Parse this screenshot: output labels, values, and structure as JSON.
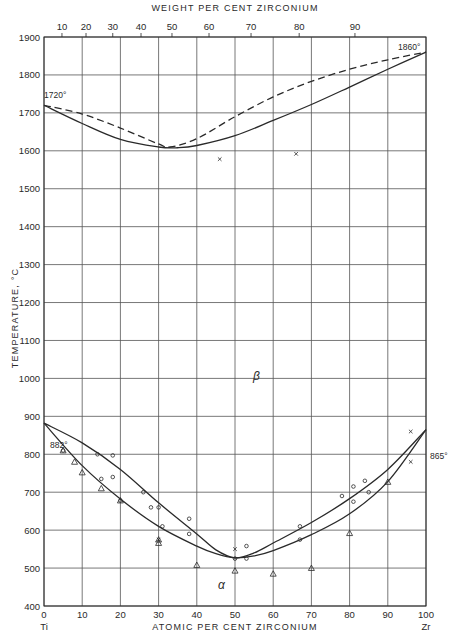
{
  "chart_data": {
    "type": "line",
    "title": "",
    "xlabel": "ATOMIC PER CENT ZIRCONIUM",
    "x2label": "WEIGHT PER CENT ZIRCONIUM",
    "ylabel": "TEMPERATURE, °C",
    "xlim": [
      0,
      100
    ],
    "ylim": [
      400,
      1900
    ],
    "grid": true,
    "x_ticks": [
      0,
      10,
      20,
      30,
      40,
      50,
      60,
      70,
      80,
      90,
      100
    ],
    "x_ticks_labels": [
      "0",
      "10",
      "20",
      "30",
      "40",
      "50",
      "60",
      "70",
      "80",
      "90",
      "100"
    ],
    "x_end_labels": {
      "left": "Ti",
      "right": "Zr"
    },
    "x2_ticks": [
      {
        "label": "10",
        "atomic_pct": 4.7
      },
      {
        "label": "20",
        "atomic_pct": 11.0
      },
      {
        "label": "30",
        "atomic_pct": 18.0
      },
      {
        "label": "40",
        "atomic_pct": 25.4
      },
      {
        "label": "50",
        "atomic_pct": 33.5
      },
      {
        "label": "60",
        "atomic_pct": 43.2
      },
      {
        "label": "70",
        "atomic_pct": 54.2
      },
      {
        "label": "80",
        "atomic_pct": 66.8
      },
      {
        "label": "90",
        "atomic_pct": 81.4
      }
    ],
    "y_ticks": [
      400,
      500,
      600,
      700,
      800,
      900,
      1000,
      1100,
      1200,
      1300,
      1400,
      1500,
      1600,
      1700,
      1800,
      1900
    ],
    "series": [
      {
        "name": "Liquidus (dashed)",
        "style": "dashed",
        "x": [
          0,
          10,
          20,
          30,
          33,
          40,
          50,
          60,
          70,
          80,
          90,
          100
        ],
        "y": [
          1720,
          1697,
          1660,
          1618,
          1610,
          1632,
          1690,
          1742,
          1783,
          1815,
          1840,
          1860
        ]
      },
      {
        "name": "Solidus (solid)",
        "style": "solid",
        "x": [
          0,
          10,
          20,
          30,
          35,
          40,
          50,
          60,
          70,
          80,
          90,
          100
        ],
        "y": [
          1720,
          1672,
          1630,
          1610,
          1608,
          1614,
          1640,
          1680,
          1722,
          1768,
          1815,
          1860
        ]
      },
      {
        "name": "Beta transus (upper, solid)",
        "style": "solid",
        "x": [
          0,
          10,
          20,
          30,
          40,
          45,
          50,
          55,
          60,
          70,
          80,
          90,
          100
        ],
        "y": [
          882,
          830,
          760,
          672,
          590,
          548,
          527,
          540,
          566,
          620,
          683,
          760,
          865
        ]
      },
      {
        "name": "Alpha transus (lower, solid)",
        "style": "solid",
        "x": [
          0,
          10,
          20,
          30,
          40,
          45,
          50,
          55,
          60,
          70,
          80,
          90,
          100
        ],
        "y": [
          882,
          770,
          682,
          610,
          558,
          538,
          527,
          532,
          546,
          588,
          643,
          728,
          865
        ]
      }
    ],
    "markers": {
      "circles": [
        {
          "x": 5,
          "y": 810
        },
        {
          "x": 15,
          "y": 735
        },
        {
          "x": 14,
          "y": 800
        },
        {
          "x": 18,
          "y": 797
        },
        {
          "x": 18,
          "y": 740
        },
        {
          "x": 20,
          "y": 678
        },
        {
          "x": 26,
          "y": 700
        },
        {
          "x": 28,
          "y": 660
        },
        {
          "x": 30,
          "y": 660
        },
        {
          "x": 31,
          "y": 610
        },
        {
          "x": 38,
          "y": 630
        },
        {
          "x": 38,
          "y": 590
        },
        {
          "x": 50,
          "y": 525
        },
        {
          "x": 53,
          "y": 558
        },
        {
          "x": 53,
          "y": 525
        },
        {
          "x": 67,
          "y": 610
        },
        {
          "x": 67,
          "y": 575
        },
        {
          "x": 78,
          "y": 690
        },
        {
          "x": 81,
          "y": 715
        },
        {
          "x": 81,
          "y": 675
        },
        {
          "x": 85,
          "y": 700
        },
        {
          "x": 84,
          "y": 730
        }
      ],
      "triangles": [
        {
          "x": 5,
          "y": 810
        },
        {
          "x": 8,
          "y": 780
        },
        {
          "x": 10,
          "y": 752
        },
        {
          "x": 15,
          "y": 710
        },
        {
          "x": 20,
          "y": 678
        },
        {
          "x": 30,
          "y": 566
        },
        {
          "x": 30,
          "y": 575
        },
        {
          "x": 40,
          "y": 508
        },
        {
          "x": 50,
          "y": 493
        },
        {
          "x": 60,
          "y": 485
        },
        {
          "x": 70,
          "y": 500
        },
        {
          "x": 80,
          "y": 592
        },
        {
          "x": 90,
          "y": 727
        }
      ],
      "crosses": [
        {
          "x": 46,
          "y": 1578
        },
        {
          "x": 66,
          "y": 1592
        },
        {
          "x": 50,
          "y": 550
        },
        {
          "x": 30,
          "y": 575
        },
        {
          "x": 96,
          "y": 860
        },
        {
          "x": 96,
          "y": 780
        }
      ]
    },
    "annotations": [
      {
        "text": "1720°",
        "x": 0,
        "y": 1720
      },
      {
        "text": "1860°",
        "x": 100,
        "y": 1860
      },
      {
        "text": "882°",
        "x": 0,
        "y": 882
      },
      {
        "text": "865°",
        "x": 100,
        "y": 865
      },
      {
        "text": "β",
        "x": 65,
        "y": 1140
      },
      {
        "text": "α",
        "x": 46,
        "y": 450
      }
    ]
  },
  "labels": {
    "x_title": "ATOMIC PER CENT ZIRCONIUM",
    "x2_title": "WEIGHT PER CENT ZIRCONIUM",
    "y_title": "TEMPERATURE, °C",
    "left_element": "Ti",
    "right_element": "Zr",
    "beta": "β",
    "alpha": "α",
    "ann_1720": "1720°",
    "ann_1860": "1860°",
    "ann_882": "882°",
    "ann_865": "865°"
  },
  "colors": {
    "ink": "#2a2a2a",
    "grid": "#555555",
    "background": "#ffffff"
  }
}
